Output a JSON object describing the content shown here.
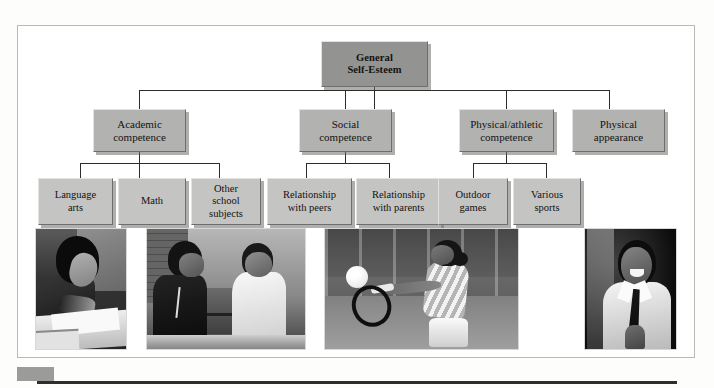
{
  "figure": {
    "colors": {
      "level1_box": "#939391",
      "level2_box": "#b2b2b0",
      "level3_box": "#c4c4c2",
      "connector": "#2c2c2c",
      "frame_border": "#b9b9b7",
      "page_background": "#fdfdfc"
    }
  },
  "diagram": {
    "type": "hierarchy",
    "root": {
      "label_line1": "General",
      "label_line2": "Self-Esteem"
    },
    "level2": [
      {
        "label_line1": "Academic",
        "label_line2": "competence"
      },
      {
        "label_line1": "Social",
        "label_line2": "competence"
      },
      {
        "label_line1": "Physical/athletic",
        "label_line2": "competence"
      },
      {
        "label_line1": "Physical",
        "label_line2": "appearance"
      }
    ],
    "level3": {
      "academic": [
        {
          "label_line1": "Language",
          "label_line2": "arts",
          "label_line3": ""
        },
        {
          "label_line1": "Math",
          "label_line2": "",
          "label_line3": ""
        },
        {
          "label_line1": "Other",
          "label_line2": "school",
          "label_line3": "subjects"
        }
      ],
      "social": [
        {
          "label_line1": "Relationship",
          "label_line2": "with peers",
          "label_line3": ""
        },
        {
          "label_line1": "Relationship",
          "label_line2": "with parents",
          "label_line3": ""
        }
      ],
      "physical": [
        {
          "label_line1": "Outdoor",
          "label_line2": "games",
          "label_line3": ""
        },
        {
          "label_line1": "Various",
          "label_line2": "sports",
          "label_line3": ""
        }
      ]
    }
  },
  "photos": [
    {
      "name": "child-writing-at-desk",
      "description": "Child writing in a notebook at a desk"
    },
    {
      "name": "two-children-at-table",
      "description": "Two children laughing together at a table"
    },
    {
      "name": "girl-playing-tennis",
      "description": "Girl hitting a ball with a tennis racket"
    },
    {
      "name": "smiling-boy-in-shirt-and-tie",
      "description": "Smiling boy wearing a shirt and tie"
    }
  ],
  "caption": {
    "text": ""
  }
}
